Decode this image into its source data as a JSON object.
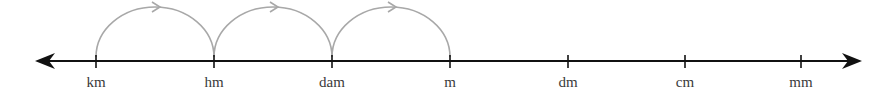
{
  "diagram": {
    "units": [
      {
        "label": "km",
        "x": 96
      },
      {
        "label": "hm",
        "x": 214
      },
      {
        "label": "dam",
        "x": 332
      },
      {
        "label": "m",
        "x": 450
      },
      {
        "label": "dm",
        "x": 568
      },
      {
        "label": "cm",
        "x": 685
      },
      {
        "label": "mm",
        "x": 801
      }
    ],
    "jumps": [
      {
        "from": "km",
        "to": "hm"
      },
      {
        "from": "hm",
        "to": "dam"
      },
      {
        "from": "dam",
        "to": "m"
      }
    ],
    "axis": {
      "y": 61,
      "x_start": 35,
      "x_end": 862,
      "arrows": "both"
    },
    "colors": {
      "axis": "#111111",
      "arc": "#a8a8a8",
      "label": "#3a3a3a"
    }
  }
}
